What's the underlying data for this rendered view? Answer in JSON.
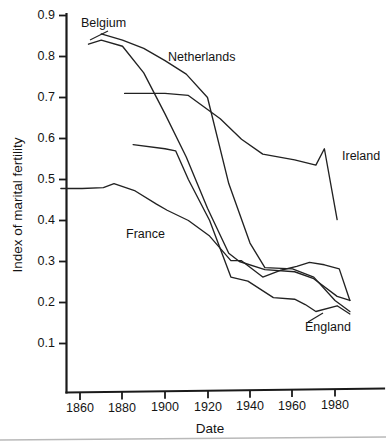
{
  "chart_data": {
    "type": "line",
    "title": "",
    "xlabel": "Date",
    "ylabel": "Index of marital fertility",
    "xlim": [
      1850,
      1990
    ],
    "ylim": [
      0.0,
      0.9
    ],
    "xticks": [
      1860,
      1880,
      1900,
      1920,
      1940,
      1960,
      1980
    ],
    "xtick_labels": [
      "1860",
      "1880",
      "1900",
      "1920",
      "1940",
      "1960",
      "1980"
    ],
    "yticks": [
      0.1,
      0.2,
      0.3,
      0.4,
      0.5,
      0.6,
      0.7,
      0.8,
      0.9
    ],
    "ytick_labels": [
      "0.1",
      "0.2",
      "0.3",
      "0.4",
      "0.5",
      "0.6",
      "0.7",
      "0.8",
      "0.9"
    ],
    "grid": false,
    "legend_position": "inline-labels",
    "series": [
      {
        "name": "Belgium",
        "label": "Belgium",
        "x": [
          1864,
          1870,
          1880,
          1890,
          1900,
          1910,
          1920,
          1930,
          1935,
          1947,
          1961,
          1970,
          1981,
          1987
        ],
        "y": [
          0.83,
          0.84,
          0.825,
          0.76,
          0.66,
          0.555,
          0.43,
          0.32,
          0.3,
          0.28,
          0.275,
          0.258,
          0.215,
          0.205
        ]
      },
      {
        "name": "Netherlands",
        "label": "Netherlands",
        "x": [
          1870,
          1880,
          1890,
          1900,
          1910,
          1920,
          1930,
          1940,
          1947,
          1960,
          1970,
          1980,
          1987
        ],
        "y": [
          0.855,
          0.84,
          0.82,
          0.79,
          0.757,
          0.7,
          0.49,
          0.345,
          0.285,
          0.282,
          0.262,
          0.205,
          0.178
        ]
      },
      {
        "name": "Ireland",
        "label": "Ireland",
        "x": [
          1881,
          1900,
          1911,
          1926,
          1936,
          1946,
          1961,
          1971,
          1975,
          1981
        ],
        "y": [
          0.71,
          0.71,
          0.705,
          0.648,
          0.598,
          0.562,
          0.548,
          0.535,
          0.575,
          0.402
        ]
      },
      {
        "name": "England",
        "label": "England",
        "x": [
          1885,
          1900,
          1905,
          1911,
          1921,
          1931,
          1939,
          1951,
          1961,
          1966,
          1971,
          1981,
          1987
        ],
        "y": [
          0.585,
          0.575,
          0.57,
          0.5,
          0.4,
          0.262,
          0.252,
          0.212,
          0.208,
          0.195,
          0.178,
          0.192,
          0.172
        ]
      },
      {
        "name": "France",
        "label": "France",
        "x": [
          1851,
          1861,
          1871,
          1876,
          1886,
          1896,
          1901,
          1911,
          1921,
          1931,
          1936,
          1946,
          1954,
          1962,
          1968,
          1975,
          1982,
          1987
        ],
        "y": [
          0.478,
          0.478,
          0.48,
          0.49,
          0.472,
          0.44,
          0.425,
          0.4,
          0.362,
          0.302,
          0.302,
          0.262,
          0.278,
          0.288,
          0.298,
          0.292,
          0.282,
          0.205
        ]
      }
    ],
    "annotations": [
      {
        "text": "Belgium",
        "x_px": 81,
        "y_px": 27,
        "leader": true
      },
      {
        "text": "Netherlands",
        "x_px": 168,
        "y_px": 61,
        "leader": false
      },
      {
        "text": "Ireland",
        "x_px": 343,
        "y_px": 160,
        "leader": false
      },
      {
        "text": "France",
        "x_px": 126,
        "y_px": 238,
        "leader": false
      },
      {
        "text": "England",
        "x_px": 305,
        "y_px": 331,
        "leader": true
      }
    ]
  }
}
